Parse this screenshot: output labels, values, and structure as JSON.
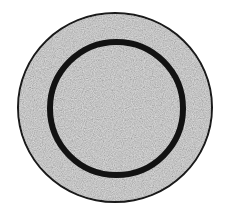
{
  "figure": {
    "colors": {
      "background": "#ffffff",
      "disc_fill": "#9a9a9a",
      "outer_edge": "#1a1a1a",
      "inner_ring": "#121212"
    },
    "shapes": {
      "outer_disc": {
        "cx": 115,
        "cy": 107.5,
        "rx": 98,
        "ry": 95.5,
        "stroke_width": 2
      },
      "inner_ring": {
        "cx": 116.5,
        "cy": 108.5,
        "r": 69.5,
        "stroke_width": 6
      }
    }
  }
}
